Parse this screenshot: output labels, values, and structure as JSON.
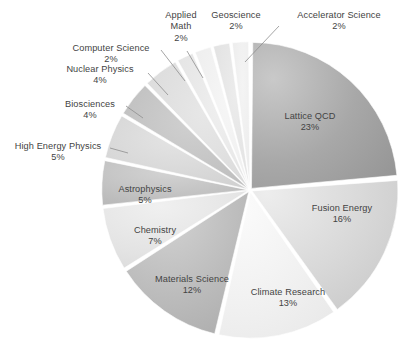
{
  "chart_data": {
    "type": "pie",
    "title": "",
    "xlabel": "",
    "ylabel": "",
    "legend_position": "none",
    "grid": false,
    "labels_inside_or_outside": "mixed",
    "total_percent": "100%",
    "categories": [
      "Lattice QCD",
      "Fusion Energy",
      "Climate Research",
      "Materials Science",
      "Chemistry",
      "Astrophysics",
      "High Energy Physics",
      "Biosciences",
      "Nuclear Physics",
      "Computer Science",
      "Applied Math",
      "Geoscience",
      "Accelerator Science"
    ],
    "values": [
      23,
      16,
      13,
      12,
      7,
      5,
      5,
      4,
      4,
      2,
      2,
      2,
      2
    ],
    "value_labels": [
      "23%",
      "16%",
      "13%",
      "12%",
      "7%",
      "5%",
      "5%",
      "4%",
      "4%",
      "2%",
      "2%",
      "2%",
      "2%"
    ],
    "colors": [
      "#9d9d9d",
      "#d8d8d8",
      "#efefef",
      "#b4b4b4",
      "#e2e2e2",
      "#b9b9b9",
      "#d4d4d4",
      "#bdbdbd",
      "#dcdcdc",
      "#e8e8e8",
      "#f0f0f0",
      "#e4e4e4",
      "#ececec"
    ]
  },
  "slices": [
    {
      "name": "Lattice QCD",
      "percent": "23%",
      "label_placement": "inside"
    },
    {
      "name": "Fusion Energy",
      "percent": "16%",
      "label_placement": "inside"
    },
    {
      "name": "Climate Research",
      "percent": "13%",
      "label_placement": "inside"
    },
    {
      "name": "Materials Science",
      "percent": "12%",
      "label_placement": "inside"
    },
    {
      "name": "Chemistry",
      "percent": "7%",
      "label_placement": "inside"
    },
    {
      "name": "Astrophysics",
      "percent": "5%",
      "label_placement": "inside"
    },
    {
      "name": "High Energy Physics",
      "percent": "5%",
      "label_placement": "outside"
    },
    {
      "name": "Biosciences",
      "percent": "4%",
      "label_placement": "outside"
    },
    {
      "name": "Nuclear Physics",
      "percent": "4%",
      "label_placement": "outside"
    },
    {
      "name": "Computer Science",
      "percent": "2%",
      "label_placement": "outside"
    },
    {
      "name": "Applied Math",
      "percent": "2%",
      "label_placement": "outside"
    },
    {
      "name": "Geoscience",
      "percent": "2%",
      "label_placement": "outside"
    },
    {
      "name": "Accelerator Science",
      "percent": "2%",
      "label_placement": "outside"
    }
  ],
  "labels": {
    "lattice_qcd": {
      "name": "Lattice QCD",
      "percent": "23%"
    },
    "fusion_energy": {
      "name": "Fusion Energy",
      "percent": "16%"
    },
    "climate_research": {
      "name": "Climate Research",
      "percent": "13%"
    },
    "materials_science": {
      "name": "Materials Science",
      "percent": "12%"
    },
    "chemistry": {
      "name": "Chemistry",
      "percent": "7%"
    },
    "astrophysics": {
      "name": "Astrophysics",
      "percent": "5%"
    },
    "high_energy_physics": {
      "name": "High Energy Physics",
      "percent": "5%"
    },
    "biosciences": {
      "name": "Biosciences",
      "percent": "4%"
    },
    "nuclear_physics": {
      "name": "Nuclear Physics",
      "percent": "4%"
    },
    "computer_science": {
      "name": "Computer Science",
      "percent": "2%"
    },
    "applied_math_line1": {
      "name": "Applied",
      "line2": "Math",
      "percent": "2%"
    },
    "geoscience": {
      "name": "Geoscience",
      "percent": "2%"
    },
    "accelerator_science": {
      "name": "Accelerator Science",
      "percent": "2%"
    }
  }
}
